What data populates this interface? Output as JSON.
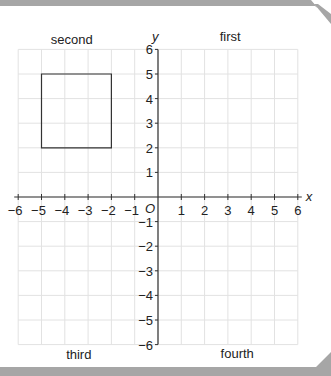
{
  "chart_data": {
    "type": "coordinate-grid",
    "x_axis": {
      "label": "x",
      "min": -6,
      "max": 6,
      "ticks": [
        -6,
        -5,
        -4,
        -3,
        -2,
        -1,
        1,
        2,
        3,
        4,
        5,
        6
      ]
    },
    "y_axis": {
      "label": "y",
      "min": -6,
      "max": 6,
      "ticks": [
        6,
        5,
        4,
        3,
        2,
        1,
        -1,
        -2,
        -3,
        -4,
        -5,
        -6
      ]
    },
    "origin_label": "O",
    "quadrant_labels": {
      "first": "first",
      "second": "second",
      "third": "third",
      "fourth": "fourth"
    },
    "shapes": [
      {
        "type": "square",
        "vertices": [
          [
            -5,
            2
          ],
          [
            -2,
            2
          ],
          [
            -2,
            5
          ],
          [
            -5,
            5
          ]
        ]
      }
    ],
    "grid": true
  },
  "colors": {
    "frame": "#a6a6a6",
    "grid": "#e2e2e2",
    "axis": "#333333"
  }
}
